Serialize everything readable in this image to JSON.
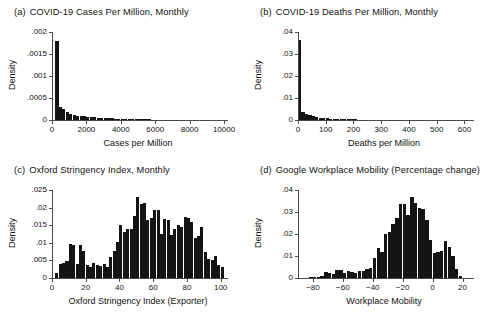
{
  "figure": {
    "background": "#ffffff",
    "bar_color": "#141414",
    "axis_color": "#4a4a4a"
  },
  "panels": [
    {
      "tag": "(a)",
      "title": "COVID-19 Cases Per Million, Monthly"
    },
    {
      "tag": "(b)",
      "title": "COVID-19 Deaths Per Million, Monthly"
    },
    {
      "tag": "(c)",
      "title": "Oxford Stringency Index, Monthly"
    },
    {
      "tag": "(d)",
      "title": "Google Workplace Mobility (Percentage change)"
    }
  ],
  "chart_data": [
    {
      "type": "bar",
      "panel": "(a)",
      "title": "COVID-19 Cases Per Million, Monthly",
      "xlabel": "Cases per Million",
      "ylabel": "Density",
      "xlim": [
        0,
        10000
      ],
      "ylim": [
        0,
        0.002
      ],
      "xticks": [
        0,
        2000,
        4000,
        6000,
        8000,
        10000
      ],
      "xticklabels": [
        "0",
        "2000",
        "4000",
        "6000",
        "8000",
        "10000"
      ],
      "yticks": [
        0,
        0.0005,
        0.001,
        0.0015,
        0.002
      ],
      "yticklabels": [
        "0",
        ".0005",
        ".001",
        ".0015",
        ".002"
      ],
      "grid": false,
      "bin_width": 200,
      "bin_starts": [
        200,
        400,
        600,
        800,
        1000,
        1200,
        1400,
        1600,
        1800,
        2000,
        2200,
        2400,
        2600,
        2800,
        3000,
        3200,
        3400,
        3600,
        3800,
        4000,
        4200,
        4400,
        4600,
        4800,
        5000,
        5200,
        5400,
        5600,
        5800,
        6000,
        6200,
        6400,
        6600,
        6800,
        7000,
        7200,
        7400,
        7600,
        7800,
        8000,
        8200,
        8400,
        8600,
        8800,
        9000,
        9200,
        9400,
        9600,
        9800
      ],
      "values": [
        0.00179,
        0.0003,
        0.00024,
        0.00019,
        0.00013,
        0.00011,
        0.0001,
        9e-05,
        8e-05,
        7e-05,
        6e-05,
        6e-05,
        5e-05,
        5e-05,
        4e-05,
        4e-05,
        4e-05,
        3e-05,
        3e-05,
        3e-05,
        2.5e-05,
        2.5e-05,
        2e-05,
        2e-05,
        2e-05,
        1.5e-05,
        1.5e-05,
        1.5e-05,
        1e-05,
        1e-05,
        1e-05,
        1e-05,
        8e-06,
        7e-06,
        6e-06,
        6e-06,
        5e-06,
        5e-06,
        5e-06,
        4e-06,
        4e-06,
        3e-06,
        3e-06,
        3e-06,
        2e-06,
        2e-06,
        2e-06,
        2e-06,
        1e-06
      ]
    },
    {
      "type": "bar",
      "panel": "(b)",
      "title": "COVID-19 Deaths Per Million, Monthly",
      "xlabel": "Deaths per Million",
      "ylabel": "Density",
      "xlim": [
        0,
        620
      ],
      "ylim": [
        0,
        0.04
      ],
      "xticks": [
        0,
        100,
        200,
        300,
        400,
        500,
        600
      ],
      "xticklabels": [
        "0",
        "100",
        "200",
        "300",
        "400",
        "500",
        "600"
      ],
      "yticks": [
        0,
        0.01,
        0.02,
        0.03,
        0.04
      ],
      "yticklabels": [
        "0",
        ".01",
        ".02",
        ".03",
        ".04"
      ],
      "grid": false,
      "bin_width": 12.5,
      "bin_starts": [
        0,
        12.5,
        25,
        37.5,
        50,
        62.5,
        75,
        87.5,
        100,
        112.5,
        125,
        137.5,
        150,
        162.5,
        175,
        187.5,
        200,
        212.5,
        225,
        237.5,
        250,
        262.5,
        275,
        287.5,
        300,
        312.5,
        325,
        337.5,
        350,
        362.5,
        375,
        387.5,
        400,
        412.5,
        425,
        437.5,
        450,
        462.5,
        475,
        487.5,
        500,
        512.5,
        525,
        537.5,
        550,
        562.5,
        575,
        587.5,
        600
      ],
      "values": [
        0.0365,
        0.0035,
        0.0028,
        0.0022,
        0.0016,
        0.0013,
        0.0011,
        0.0009,
        0.0007,
        0.0005,
        0.00045,
        0.0004,
        0.00035,
        0.0003,
        0.0003,
        0.00025,
        0.00025,
        0.0002,
        0.0002,
        0.0002,
        0.00018,
        0.00015,
        0.00012,
        0.0001,
        0.0001,
        8e-05,
        8e-05,
        7e-05,
        6e-05,
        6e-05,
        5e-05,
        5e-05,
        4e-05,
        4e-05,
        3e-05,
        3e-05,
        2.5e-05,
        2e-05,
        2e-05,
        1.5e-05,
        1.5e-05,
        1e-05,
        1e-05,
        1e-05,
        8e-06,
        8e-06,
        6e-06,
        5e-06,
        4e-06
      ]
    },
    {
      "type": "bar",
      "panel": "(c)",
      "title": "Oxford Stringency Index, Monthly",
      "xlabel": "Oxford Stringency Index (Exporter)",
      "ylabel": "Density",
      "xlim": [
        0,
        102
      ],
      "ylim": [
        0,
        0.025
      ],
      "xticks": [
        0,
        20,
        40,
        60,
        80,
        100
      ],
      "xticklabels": [
        "0",
        "20",
        "40",
        "60",
        "80",
        "100"
      ],
      "yticks": [
        0,
        0.005,
        0.01,
        0.015,
        0.02,
        0.025
      ],
      "yticklabels": [
        "0",
        ".005",
        ".01",
        ".015",
        ".02",
        ".025"
      ],
      "grid": false,
      "bin_width": 2,
      "bin_starts": [
        2,
        4,
        6,
        8,
        10,
        12,
        14,
        16,
        18,
        20,
        22,
        24,
        26,
        28,
        30,
        32,
        34,
        36,
        38,
        40,
        42,
        44,
        46,
        48,
        50,
        52,
        54,
        56,
        58,
        60,
        62,
        64,
        66,
        68,
        70,
        72,
        74,
        76,
        78,
        80,
        82,
        84,
        86,
        88,
        90,
        92,
        94,
        96,
        98,
        100
      ],
      "values": [
        0.0013,
        0.004,
        0.0043,
        0.0048,
        0.0097,
        0.0095,
        0.0039,
        0.0094,
        0.0078,
        0.0037,
        0.003,
        0.0044,
        0.0036,
        0.0033,
        0.004,
        0.003,
        0.006,
        0.0078,
        0.0102,
        0.015,
        0.013,
        0.0138,
        0.014,
        0.0175,
        0.023,
        0.021,
        0.0213,
        0.0165,
        0.017,
        0.0194,
        0.0194,
        0.0125,
        0.0167,
        0.0165,
        0.0123,
        0.014,
        0.0152,
        0.0146,
        0.0172,
        0.017,
        0.016,
        0.0115,
        0.0118,
        0.0144,
        0.0075,
        0.0055,
        0.0052,
        0.0062,
        0.0036,
        0.003
      ]
    },
    {
      "type": "bar",
      "panel": "(d)",
      "title": "Google Workplace Mobility (Percentage change)",
      "xlabel": "Workplace Mobility",
      "ylabel": "Density",
      "xlim": [
        -90,
        25
      ],
      "ylim": [
        0,
        0.04
      ],
      "xticks": [
        -80,
        -60,
        -40,
        -20,
        0,
        20
      ],
      "xticklabels": [
        "−80",
        "−60",
        "−40",
        "−20",
        "0",
        "20"
      ],
      "yticks": [
        0,
        0.01,
        0.02,
        0.03,
        0.04
      ],
      "yticklabels": [
        "0",
        ".01",
        ".02",
        ".03",
        ".04"
      ],
      "grid": false,
      "bin_width": 2.5,
      "bin_starts": [
        -87.5,
        -85,
        -82.5,
        -80,
        -77.5,
        -75,
        -72.5,
        -70,
        -67.5,
        -65,
        -62.5,
        -60,
        -57.5,
        -55,
        -52.5,
        -50,
        -47.5,
        -45,
        -42.5,
        -40,
        -37.5,
        -35,
        -32.5,
        -30,
        -27.5,
        -25,
        -22.5,
        -20,
        -17.5,
        -15,
        -12.5,
        -10,
        -7.5,
        -5,
        -2.5,
        0,
        2.5,
        5,
        7.5,
        10,
        12.5,
        15,
        17.5
      ],
      "values": [
        0.0002,
        0.0002,
        0.0003,
        0.0004,
        0.0006,
        0.001,
        0.0026,
        0.0025,
        0.002,
        0.0038,
        0.0038,
        0.0022,
        0.0031,
        0.0028,
        0.0023,
        0.0033,
        0.0031,
        0.0042,
        0.0046,
        0.0092,
        0.0136,
        0.0116,
        0.02,
        0.0207,
        0.0245,
        0.0275,
        0.0335,
        0.0338,
        0.0287,
        0.037,
        0.034,
        0.032,
        0.0315,
        0.0265,
        0.0175,
        0.0115,
        0.012,
        0.0123,
        0.0168,
        0.0142,
        0.01,
        0.004,
        0.0008
      ]
    }
  ]
}
